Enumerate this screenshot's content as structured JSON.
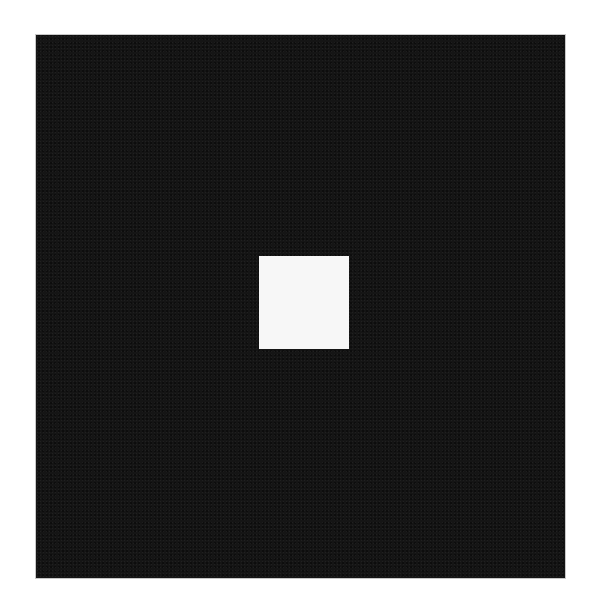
{
  "image": {
    "background_color": "#ffffff",
    "shapes": [
      {
        "name": "dark-square",
        "color": "#151515",
        "x": 36,
        "y": 35,
        "width": 529,
        "height": 543
      },
      {
        "name": "light-square",
        "color": "#f7f7f7",
        "x": 259,
        "y": 256,
        "width": 90,
        "height": 93
      }
    ]
  }
}
